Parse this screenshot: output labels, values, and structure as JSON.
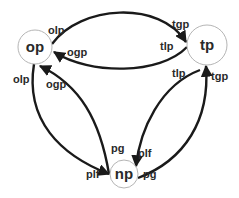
{
  "nodes": {
    "op": {
      "label": "op"
    },
    "tp": {
      "label": "tp"
    },
    "np": {
      "label": "np"
    }
  },
  "edges": {
    "op_to_tp": {
      "src_label": "olp",
      "dst_label": "tgp"
    },
    "tp_to_op": {
      "src_label": "tlp",
      "dst_label": "ogp"
    },
    "op_to_np": {
      "src_label": "olp",
      "dst_label": "plf"
    },
    "np_to_op": {
      "src_label": "pg",
      "dst_label": "ogp"
    },
    "tp_to_np": {
      "src_label": "tlp",
      "dst_label": "plf"
    },
    "np_to_tp": {
      "src_label": "pg",
      "dst_label": "tgp"
    }
  },
  "colors": {
    "edge": "#1a1a1a",
    "node_stroke": "#b5b5b5",
    "text": "#2a2a2a"
  }
}
